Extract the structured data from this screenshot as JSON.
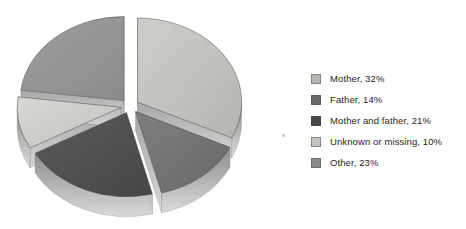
{
  "chart_data": {
    "type": "pie",
    "style": "3d-exploded",
    "title": "",
    "labels": [
      "Mother",
      "Father",
      "Mother and father",
      "Unknown or missing",
      "Other"
    ],
    "values": [
      32,
      14,
      21,
      10,
      23
    ],
    "unit": "%",
    "legend_entries": [
      "Mother, 32%",
      "Father, 14%",
      "Mother and father, 21%",
      "Unknown or missing, 10%",
      "Other, 23%"
    ],
    "colors": [
      "#b3b6b1",
      "#676966",
      "#454744",
      "#c2c4bf",
      "#8a8c89"
    ],
    "colors_light": [
      "#cdcfca",
      "#7e807d",
      "#5a5c59",
      "#d6d8d3",
      "#9da09c"
    ],
    "wall_color_top": "#8d8d8d",
    "wall_color_bottom": "#dadada",
    "cut_color_top": "#a6a6a6",
    "cut_color_bottom": "#d6d6d6",
    "outline_color": "#3f3f3f",
    "background": "#ffffff",
    "start_angle_deg": 0,
    "clockwise": true,
    "legend_position": "right",
    "layout": {
      "cx": 130,
      "cy": 106,
      "rx": 104,
      "ry": 84,
      "depth": 20,
      "explode": 9
    }
  }
}
